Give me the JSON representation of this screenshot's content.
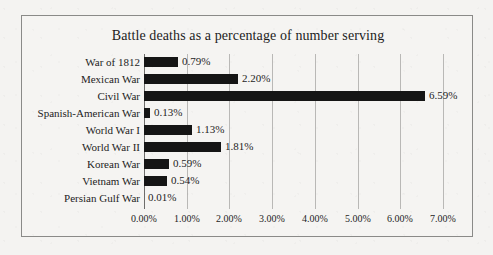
{
  "chart_data": {
    "type": "bar",
    "orientation": "horizontal",
    "title": "Battle deaths as a percentage of number serving",
    "xlabel": "",
    "ylabel": "",
    "xlim": [
      0,
      7
    ],
    "grid": true,
    "legend": false,
    "categories": [
      "War of 1812",
      "Mexican War",
      "Civil War",
      "Spanish-American War",
      "World War I",
      "World War II",
      "Korean War",
      "Vietnam War",
      "Persian Gulf War"
    ],
    "values": [
      0.79,
      2.2,
      6.59,
      0.13,
      1.13,
      1.81,
      0.59,
      0.54,
      0.01
    ],
    "value_labels": [
      "0.79%",
      "2.20%",
      "6.59%",
      "0.13%",
      "1.13%",
      "1.81%",
      "0.59%",
      "0.54%",
      "0.01%"
    ],
    "xticks": [
      0,
      1,
      2,
      3,
      4,
      5,
      6,
      7
    ],
    "xtick_labels": [
      "0.00%",
      "1.00%",
      "2.00%",
      "3.00%",
      "4.00%",
      "5.00%",
      "6.00%",
      "7.00%"
    ],
    "bar_color": "#151515",
    "grid_color": "#b9b8b6",
    "background_color": "#f5f4f2",
    "border_color": "#8a8a88"
  }
}
